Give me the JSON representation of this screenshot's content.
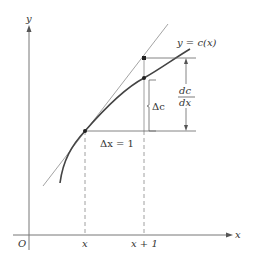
{
  "diagram": {
    "type": "marginal-cost-tangent",
    "axes": {
      "y_label": "y",
      "x_label": "x",
      "origin_label": "O"
    },
    "x_ticks": [
      "x",
      "x + 1"
    ],
    "curve_label": "y = c(x)",
    "delta_x_label": "Δx = 1",
    "delta_c_label": "Δc",
    "derivative_label": {
      "numerator": "dc",
      "denominator": "dx"
    },
    "colors": {
      "axis": "#777777",
      "curve": "#444444",
      "tangent": "#999999",
      "guide": "#666666",
      "text": "#333333"
    }
  }
}
